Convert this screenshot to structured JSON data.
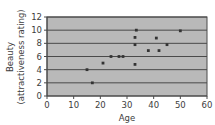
{
  "chart_data": {
    "type": "scatter",
    "title": "",
    "xlabel": "Age",
    "ylabel": "Beauty (attractiveness rating)",
    "ylabel_line1": "Beauty",
    "ylabel_line2": "(attractiveness rating)",
    "xlim": [
      0,
      60
    ],
    "ylim": [
      0,
      12
    ],
    "xticks": [
      0,
      10,
      20,
      30,
      40,
      50,
      60
    ],
    "yticks": [
      0,
      2,
      4,
      6,
      8,
      10,
      12
    ],
    "grid": "horizontal",
    "legend": "none",
    "plot_background": "#b9b9b9",
    "point_color": "#333333",
    "grid_color": "#4a4a4a",
    "frame_color": "#4a4a4a",
    "points": [
      {
        "x": 17,
        "y": 2
      },
      {
        "x": 15,
        "y": 4
      },
      {
        "x": 21,
        "y": 5
      },
      {
        "x": 24,
        "y": 6
      },
      {
        "x": 27,
        "y": 6
      },
      {
        "x": 28.5,
        "y": 6
      },
      {
        "x": 33,
        "y": 4.8
      },
      {
        "x": 33,
        "y": 7.8
      },
      {
        "x": 33,
        "y": 8.9
      },
      {
        "x": 33.5,
        "y": 10
      },
      {
        "x": 38,
        "y": 6.9
      },
      {
        "x": 41,
        "y": 8.8
      },
      {
        "x": 42,
        "y": 6.9
      },
      {
        "x": 45,
        "y": 7.8
      },
      {
        "x": 50,
        "y": 9.9
      }
    ]
  }
}
